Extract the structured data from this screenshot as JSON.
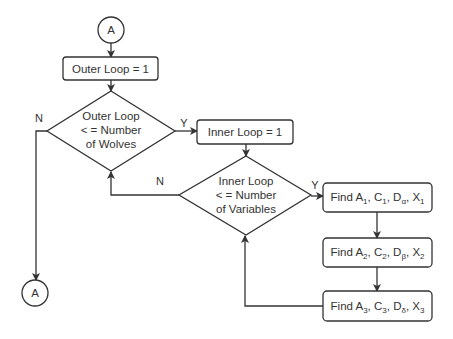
{
  "diagram": {
    "type": "flowchart",
    "connectors": {
      "start": {
        "label": "A"
      },
      "end": {
        "label": "A"
      }
    },
    "nodes": {
      "outer_init": {
        "label": "Outer Loop = 1"
      },
      "outer_cond": {
        "lines": [
          "Outer Loop",
          "< = Number",
          "of Wolves"
        ]
      },
      "inner_init": {
        "label": "Inner Loop = 1"
      },
      "inner_cond": {
        "lines": [
          "Inner Loop",
          "< = Number",
          "of Variables"
        ]
      },
      "find1": {
        "prefix": "Find ",
        "terms": [
          {
            "base": "A",
            "sub": "1"
          },
          {
            "base": "C",
            "sub": "1"
          },
          {
            "base": "D",
            "sub": "α"
          },
          {
            "base": "X",
            "sub": "1"
          }
        ]
      },
      "find2": {
        "prefix": "Find ",
        "terms": [
          {
            "base": "A",
            "sub": "2"
          },
          {
            "base": "C",
            "sub": "2"
          },
          {
            "base": "D",
            "sub": "β"
          },
          {
            "base": "X",
            "sub": "2"
          }
        ]
      },
      "find3": {
        "prefix": "Find ",
        "terms": [
          {
            "base": "A",
            "sub": "3"
          },
          {
            "base": "C",
            "sub": "3"
          },
          {
            "base": "D",
            "sub": "δ"
          },
          {
            "base": "X",
            "sub": "3"
          }
        ]
      }
    },
    "edge_labels": {
      "outer_yes": "Y",
      "outer_no": "N",
      "inner_yes": "Y",
      "inner_no": "N"
    },
    "colors": {
      "stroke": "#333333",
      "fill": "#ffffff",
      "text": "#333333"
    }
  }
}
